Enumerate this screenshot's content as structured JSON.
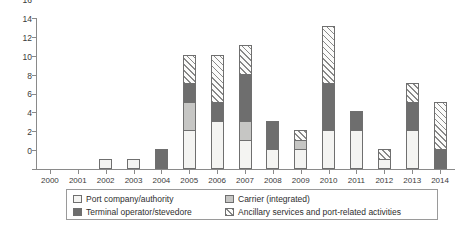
{
  "chart_data": {
    "type": "bar",
    "subtype": "stacked-vertical",
    "title": "",
    "subtitle": "",
    "xlabel": "",
    "ylabel": "",
    "categories": [
      "2000",
      "2001",
      "2002",
      "2003",
      "2004",
      "2005",
      "2006",
      "2007",
      "2008",
      "2009",
      "2010",
      "2011",
      "2012",
      "2013",
      "2014"
    ],
    "series": [
      {
        "name": "Port company/authority",
        "key": "port",
        "fill": "white",
        "color": "#f4f4f2",
        "values": [
          0,
          0,
          1,
          1,
          0,
          4,
          5,
          3,
          2,
          2,
          4,
          4,
          1,
          4,
          0
        ]
      },
      {
        "name": "Carrier (integrated)",
        "key": "carrier",
        "fill": "light-gray",
        "color": "#c6c6c4",
        "values": [
          0,
          0,
          0,
          0,
          0,
          3,
          0,
          2,
          0,
          1,
          0,
          0,
          0,
          0,
          0
        ]
      },
      {
        "name": "Terminal operator/stevedore",
        "key": "terminal",
        "fill": "dark-gray",
        "color": "#6e6e6e",
        "values": [
          0,
          0,
          0,
          0,
          2,
          2,
          2,
          5,
          3,
          0,
          5,
          2,
          0,
          3,
          2
        ]
      },
      {
        "name": "Ancillary services and port-related activities",
        "key": "ancillary",
        "fill": "diagonal-hatch",
        "color": "#fbfbfa",
        "values": [
          0,
          0,
          0,
          0,
          0,
          3,
          5,
          3,
          0,
          1,
          6,
          0,
          1,
          2,
          5
        ]
      }
    ],
    "totals": [
      0,
      0,
      1,
      1,
      2,
      12,
      12,
      13,
      5,
      4,
      15,
      6,
      2,
      9,
      7
    ],
    "ylim": [
      0,
      16
    ],
    "ytick_values": [
      0,
      2,
      4,
      6,
      8,
      10,
      12,
      14,
      16
    ],
    "ytick_labels": [
      "0",
      "2",
      "4",
      "6",
      "8",
      "10",
      "12",
      "14",
      "16"
    ],
    "grid": false,
    "legend_position": "bottom"
  },
  "legend": {
    "entries": [
      {
        "label": "Port company/authority",
        "swatch": "white-square-icon"
      },
      {
        "label": "Carrier (integrated)",
        "swatch": "light-gray-square-icon"
      },
      {
        "label": "Terminal operator/stevedore",
        "swatch": "dark-gray-square-icon"
      },
      {
        "label": "Ancillary services and port-related activities",
        "swatch": "hatched-square-icon"
      }
    ]
  }
}
